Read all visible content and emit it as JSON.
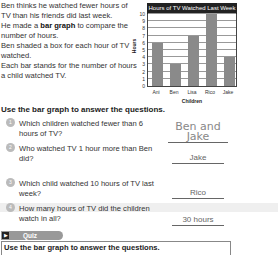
{
  "intro": {
    "line1": "Ben thinks he watched fewer hours of TV than his friends did last week.",
    "line2_pre": "He made a ",
    "line2_bold": "bar graph",
    "line2_post": " to compare the number of hours.",
    "line3": "Ben shaded a box for each hour of TV watched.",
    "line4": "Each bar stands for the number of hours a child watched TV."
  },
  "chart_data": {
    "type": "bar",
    "title": "Hours of TV Watched Last Week",
    "categories": [
      "Ani",
      "Ben",
      "Lisa",
      "Rico",
      "Jake"
    ],
    "values": [
      6,
      3,
      7,
      10,
      4
    ],
    "xlabel": "Children",
    "ylabel": "Hours",
    "ylim": [
      0,
      10
    ],
    "yticks": [
      "0",
      "1",
      "2",
      "3",
      "4",
      "5",
      "6",
      "7",
      "8",
      "9",
      "10"
    ],
    "grid": true,
    "bar_color": "#8a8a8a"
  },
  "instructions": "Use the bar graph to answer the questions.",
  "questions": [
    {
      "num": "1",
      "text": "Which children watched fewer than 6 hours of TV?",
      "answer": "Ben and Jake"
    },
    {
      "num": "2",
      "text": "Who watched TV 1 hour more than Ben did?",
      "answer": "Jake"
    },
    {
      "num": "3",
      "text": "Which child watched 10 hours of TV last week?",
      "answer": "Rico"
    },
    {
      "num": "4",
      "text": "How many hours of TV did the children watch in all?",
      "answer": "30 hours"
    }
  ],
  "quiz": {
    "icon": "▶",
    "label": "Quiz",
    "instructions": "Use the bar graph to answer the questions."
  }
}
